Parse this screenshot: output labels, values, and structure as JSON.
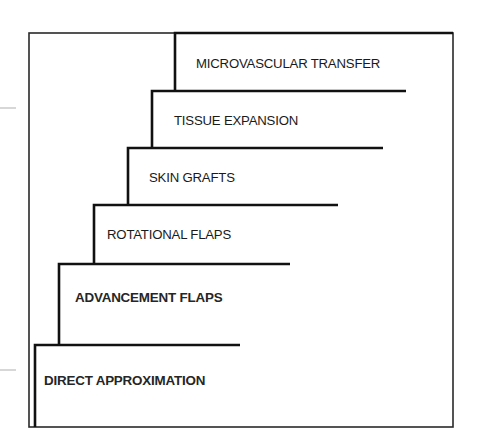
{
  "diagram": {
    "frame": {
      "x1": 29,
      "y1": 33,
      "x2": 453,
      "y2": 427,
      "color": "#2a2a2a"
    },
    "ticks": [
      {
        "y": 108,
        "x1": 0,
        "x2": 16,
        "color": "#bdbdbd"
      },
      {
        "y": 370,
        "x1": 0,
        "x2": 16,
        "color": "#bdbdbd"
      }
    ],
    "steps": [
      {
        "label": "MICROVASCULAR TRANSFER",
        "vx": 175,
        "top": 33,
        "bottom": 91,
        "end": 453,
        "text_x": 196,
        "text_y": 68,
        "bold": false
      },
      {
        "label": "TISSUE EXPANSION",
        "vx": 152,
        "top": 91,
        "bottom": 148,
        "end": 406,
        "text_x": 174,
        "text_y": 125,
        "bold": false
      },
      {
        "label": "SKIN GRAFTS",
        "vx": 128,
        "top": 148,
        "bottom": 205,
        "end": 383,
        "text_x": 149,
        "text_y": 182,
        "bold": false
      },
      {
        "label": "ROTATIONAL FLAPS",
        "vx": 94,
        "top": 205,
        "bottom": 264,
        "end": 338,
        "text_x": 107,
        "text_y": 239,
        "bold": false
      },
      {
        "label": "ADVANCEMENT FLAPS",
        "vx": 59,
        "top": 264,
        "bottom": 345,
        "end": 290,
        "text_x": 75,
        "text_y": 302,
        "bold": true
      },
      {
        "label": "DIRECT APPROXIMATION",
        "vx": 35,
        "top": 345,
        "bottom": 427,
        "end": 240,
        "text_x": 44,
        "text_y": 385,
        "bold": true
      }
    ],
    "line_color": "#111111",
    "text_color": "#1a1a1a"
  }
}
